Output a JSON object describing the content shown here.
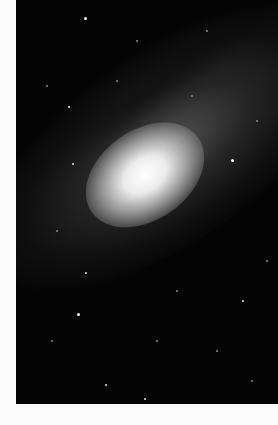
{
  "image": {
    "subject": "spiral galaxy photograph",
    "background_color": "#040404",
    "page_color": "#fbfbfb",
    "core_color": "#ffffff"
  }
}
